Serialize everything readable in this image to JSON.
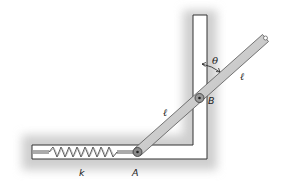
{
  "figure": {
    "labels": {
      "theta": "θ",
      "length_upper": "ℓ",
      "length_lower": "ℓ",
      "point_b": "B",
      "point_a": "A",
      "spring_constant": "k"
    },
    "colors": {
      "background": "#ffffff",
      "shadow": "#c8c8c8",
      "frame_stroke": "#333333",
      "rod_fill": "#c9c9c9",
      "rod_stroke": "#555555",
      "spring": "#444444"
    }
  }
}
